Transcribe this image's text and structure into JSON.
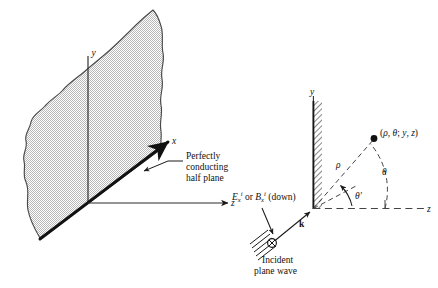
{
  "figure": {
    "left_panel": {
      "name": "perspective-half-plane-diagram",
      "axis_y_label": "y",
      "axis_x_label": "x",
      "axis_z_label": "z",
      "annotation_lines": [
        "Perfectly",
        "conducting",
        "half plane"
      ],
      "annotation_text": "Perfectly conducting half plane",
      "surface_fill_color": "#d8d8d8",
      "surface_outline_color": "#3a3a3a",
      "edge_color": "#111111",
      "axis_color": "#2b2b2b"
    },
    "right_panel": {
      "name": "cross-section-polar-diagram",
      "axis_y_label": "y",
      "axis_z_label": "z",
      "field_point_label": "(ρ, θ; y, z)",
      "field_point_label_parts": {
        "open": "(",
        "rho": "ρ",
        "comma1": ", ",
        "theta": "θ",
        "semicolon": "; ",
        "y": "y",
        "comma2": ", ",
        "z": "z",
        "close": ")"
      },
      "radius_label": "ρ",
      "angle_label": "θ",
      "incidence_angle_label": "θ′",
      "wavevector_label": "k",
      "polarization_label": {
        "e_base": "E",
        "e_sub": "x",
        "e_sup": "i",
        "conjunction": " or ",
        "b_base": "B",
        "b_sub": "x",
        "b_sup": "i",
        "direction": " (down)",
        "full": "Eₓⁱ or Bₓⁱ (down)"
      },
      "incident_wave_lines": [
        "Incident",
        "plane wave"
      ],
      "incident_wave_text": "Incident plane wave",
      "polarization_symbol": "circled-x",
      "screen_hatch_color": "#2b2b2b",
      "dashed_color": "#444444"
    }
  }
}
